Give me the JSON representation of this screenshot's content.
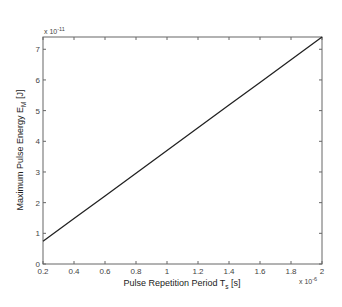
{
  "chart_data": {
    "type": "line",
    "title": "",
    "xlabel": "Pulse Repetition Period T_s [s]",
    "ylabel": "Maximum Pulse Energy E_M [J]",
    "x_multiplier": "x 10^-6",
    "y_multiplier": "x 10^-11",
    "xlim": [
      0.2,
      2.0
    ],
    "ylim": [
      0,
      7.4
    ],
    "x_ticks": [
      0.2,
      0.4,
      0.6,
      0.8,
      1,
      1.2,
      1.4,
      1.6,
      1.8,
      2
    ],
    "x_tick_labels": [
      "0.2",
      "0.4",
      "0.6",
      "0.8",
      "1",
      "1.2",
      "1.4",
      "1.6",
      "1.8",
      "2"
    ],
    "y_ticks": [
      0,
      1,
      2,
      3,
      4,
      5,
      6,
      7
    ],
    "y_tick_labels": [
      "0",
      "1",
      "2",
      "3",
      "4",
      "5",
      "6",
      "7"
    ],
    "grid": false,
    "legend": null,
    "series": [
      {
        "name": "E_M vs T_s",
        "color": "#222222",
        "x": [
          0.2,
          0.4,
          0.6,
          0.8,
          1.0,
          1.2,
          1.4,
          1.6,
          1.8,
          2.0
        ],
        "y": [
          0.74,
          1.48,
          2.22,
          2.96,
          3.7,
          4.44,
          5.18,
          5.92,
          6.66,
          7.4
        ]
      }
    ]
  },
  "labels": {
    "xlabel_main": "Pulse Repetition Period T",
    "xlabel_sub": "s",
    "xlabel_unit": " [s]",
    "ylabel_main": "Maximum Pulse Energy E",
    "ylabel_sub": "M",
    "ylabel_unit": " [J]",
    "x_exp_base": "x 10",
    "x_exp_power": "-6",
    "y_exp_base": "x 10",
    "y_exp_power": "-11"
  }
}
